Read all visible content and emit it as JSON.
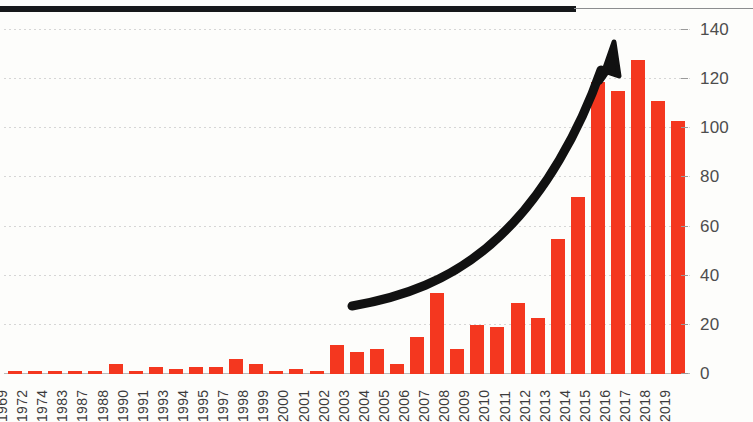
{
  "chart_data": {
    "type": "bar",
    "title": "",
    "subtitle": "",
    "xlabel": "",
    "ylabel": "",
    "ylim": [
      0,
      140
    ],
    "yticks": [
      0,
      20,
      40,
      60,
      80,
      100,
      120,
      140
    ],
    "grid": true,
    "legend": false,
    "bar_color": "#f4371f",
    "categories": [
      "1969",
      "1972",
      "1974",
      "1983",
      "1987",
      "1988",
      "1990",
      "1991",
      "1993",
      "1994",
      "1995",
      "1997",
      "1998",
      "1999",
      "2000",
      "2001",
      "2002",
      "2003",
      "2004",
      "2005",
      "2006",
      "2007",
      "2008",
      "2009",
      "2010",
      "2011",
      "2012",
      "2013",
      "2014",
      "2015",
      "2016",
      "2017",
      "2018",
      "2019"
    ],
    "values": [
      1,
      1,
      1,
      1,
      1,
      4,
      1,
      3,
      2,
      3,
      3,
      6,
      4,
      1,
      2,
      1,
      12,
      9,
      10,
      4,
      15,
      33,
      10,
      20,
      19,
      29,
      23,
      55,
      72,
      119,
      115,
      128,
      111,
      103
    ],
    "annotations": [
      {
        "name": "growth-arrow",
        "type": "curved-arrow",
        "color": "#111111",
        "description": "thick black upward exponential curve arrow"
      }
    ]
  },
  "axes": {
    "y_tick_labels": [
      "0",
      "20",
      "40",
      "60",
      "80",
      "100",
      "120",
      "140"
    ],
    "x_tick_labels": [
      "1969",
      "1972",
      "1974",
      "1983",
      "1987",
      "1988",
      "1990",
      "1991",
      "1993",
      "1994",
      "1995",
      "1997",
      "1998",
      "1999",
      "2000",
      "2001",
      "2002",
      "2003",
      "2004",
      "2005",
      "2006",
      "2007",
      "2008",
      "2009",
      "2010",
      "2011",
      "2012",
      "2013",
      "2014",
      "2015",
      "2016",
      "2017",
      "2018",
      "2019"
    ]
  },
  "decor": {
    "top_rule": "",
    "icons": {
      "arrow": "growth-arrow-icon"
    }
  }
}
